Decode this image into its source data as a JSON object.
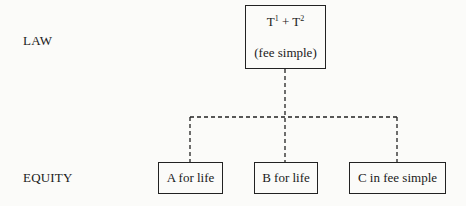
{
  "rows": {
    "law_label": "LAW",
    "equity_label": "EQUITY"
  },
  "legal_title": {
    "holders_t1": "T",
    "t1_sup": "1",
    "plus": " + ",
    "holders_t2": "T",
    "t2_sup": "2",
    "estate": "(fee simple)"
  },
  "beneficiaries": [
    {
      "label": "A for life"
    },
    {
      "label": "B for life"
    },
    {
      "label": "C in fee simple"
    }
  ],
  "connector_style": "dashed"
}
